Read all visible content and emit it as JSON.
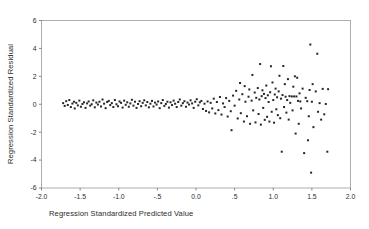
{
  "chart_data": {
    "type": "scatter",
    "title": "",
    "subtitle": "",
    "xlabel": "Regression Standardized Predicted Value",
    "ylabel": "Regression Standardized Residual",
    "xlim": [
      -2.0,
      2.0
    ],
    "ylim": [
      -6,
      6
    ],
    "xticks": [
      -2.0,
      -1.5,
      -1.0,
      -0.5,
      0.0,
      0.5,
      1.0,
      1.5,
      2.0
    ],
    "xtick_labels": [
      "-2.0",
      "-1.5",
      "-1.0",
      "-.5",
      "0.0",
      ".5",
      "1.0",
      "1.5",
      "2.0"
    ],
    "yticks": [
      -6,
      -4,
      -2,
      0,
      2,
      4,
      6
    ],
    "ytick_labels": [
      "-6",
      "-4",
      "-2",
      "0",
      "2",
      "4",
      "6"
    ],
    "grid": false,
    "legend": null,
    "legend_position": "none",
    "marker": "square",
    "marker_size": 2.0,
    "marker_color": "#262626",
    "series": [
      {
        "name": "Residuals",
        "points": [
          [
            -1.72,
            0.08
          ],
          [
            -1.7,
            -0.12
          ],
          [
            -1.68,
            0.22
          ],
          [
            -1.66,
            -0.05
          ],
          [
            -1.64,
            0.3
          ],
          [
            -1.62,
            -0.2
          ],
          [
            -1.6,
            0.05
          ],
          [
            -1.58,
            0.18
          ],
          [
            -1.57,
            -0.3
          ],
          [
            -1.55,
            0.1
          ],
          [
            -1.53,
            -0.08
          ],
          [
            -1.51,
            0.26
          ],
          [
            -1.49,
            -0.18
          ],
          [
            -1.47,
            0.02
          ],
          [
            -1.45,
            0.14
          ],
          [
            -1.43,
            -0.26
          ],
          [
            -1.41,
            0.06
          ],
          [
            -1.39,
            0.2
          ],
          [
            -1.37,
            -0.1
          ],
          [
            -1.35,
            0.0
          ],
          [
            -1.33,
            0.28
          ],
          [
            -1.31,
            -0.22
          ],
          [
            -1.29,
            0.12
          ],
          [
            -1.27,
            -0.02
          ],
          [
            -1.25,
            0.18
          ],
          [
            -1.23,
            -0.16
          ],
          [
            -1.21,
            0.34
          ],
          [
            -1.19,
            0.04
          ],
          [
            -1.17,
            -0.28
          ],
          [
            -1.15,
            0.16
          ],
          [
            -1.13,
            0.24
          ],
          [
            -1.11,
            -0.06
          ],
          [
            -1.09,
            0.08
          ],
          [
            -1.07,
            -0.2
          ],
          [
            -1.05,
            0.3
          ],
          [
            -1.03,
            0.0
          ],
          [
            -1.01,
            -0.14
          ],
          [
            -0.99,
            0.2
          ],
          [
            -0.97,
            0.1
          ],
          [
            -0.95,
            -0.24
          ],
          [
            -0.93,
            0.26
          ],
          [
            -0.91,
            -0.04
          ],
          [
            -0.89,
            0.14
          ],
          [
            -0.87,
            -0.18
          ],
          [
            -0.85,
            0.06
          ],
          [
            -0.83,
            0.32
          ],
          [
            -0.81,
            -0.1
          ],
          [
            -0.79,
            0.18
          ],
          [
            -0.77,
            -0.26
          ],
          [
            -0.75,
            0.02
          ],
          [
            -0.73,
            0.22
          ],
          [
            -0.71,
            -0.14
          ],
          [
            -0.69,
            0.1
          ],
          [
            -0.67,
            0.28
          ],
          [
            -0.65,
            -0.08
          ],
          [
            -0.63,
            0.16
          ],
          [
            -0.61,
            -0.22
          ],
          [
            -0.59,
            0.04
          ],
          [
            -0.57,
            0.24
          ],
          [
            -0.55,
            -0.16
          ],
          [
            -0.53,
            0.12
          ],
          [
            -0.51,
            -0.02
          ],
          [
            -0.49,
            0.2
          ],
          [
            -0.47,
            -0.28
          ],
          [
            -0.45,
            0.08
          ],
          [
            -0.43,
            0.3
          ],
          [
            -0.41,
            -0.12
          ],
          [
            -0.39,
            0.02
          ],
          [
            -0.37,
            0.18
          ],
          [
            -0.35,
            -0.24
          ],
          [
            -0.33,
            0.14
          ],
          [
            -0.31,
            -0.06
          ],
          [
            -0.29,
            0.26
          ],
          [
            -0.27,
            0.04
          ],
          [
            -0.25,
            -0.2
          ],
          [
            -0.23,
            0.16
          ],
          [
            -0.21,
            0.34
          ],
          [
            -0.19,
            -0.1
          ],
          [
            -0.17,
            0.08
          ],
          [
            -0.15,
            0.22
          ],
          [
            -0.13,
            -0.18
          ],
          [
            -0.11,
            0.12
          ],
          [
            -0.09,
            -0.02
          ],
          [
            -0.07,
            0.28
          ],
          [
            -0.05,
            0.06
          ],
          [
            -0.03,
            -0.26
          ],
          [
            -0.01,
            0.18
          ],
          [
            0.01,
            0.36
          ],
          [
            0.03,
            -0.08
          ],
          [
            0.05,
            0.14
          ],
          [
            0.07,
            0.24
          ],
          [
            0.09,
            -0.34
          ],
          [
            0.11,
            0.04
          ],
          [
            0.13,
            -0.48
          ],
          [
            0.15,
            0.2
          ],
          [
            0.17,
            -0.58
          ],
          [
            0.19,
            0.1
          ],
          [
            0.21,
            -0.3
          ],
          [
            0.23,
            0.4
          ],
          [
            0.25,
            -0.66
          ],
          [
            0.27,
            0.16
          ],
          [
            0.29,
            -0.42
          ],
          [
            0.31,
            0.52
          ],
          [
            0.33,
            -0.74
          ],
          [
            0.35,
            0.06
          ],
          [
            0.37,
            -0.2
          ],
          [
            0.39,
            0.44
          ],
          [
            0.41,
            -0.88
          ],
          [
            0.43,
            0.24
          ],
          [
            0.45,
            -0.5
          ],
          [
            0.46,
            -1.86
          ],
          [
            0.48,
            0.62
          ],
          [
            0.5,
            -0.1
          ],
          [
            0.52,
            0.96
          ],
          [
            0.54,
            -1.02
          ],
          [
            0.56,
            0.34
          ],
          [
            0.57,
            1.52
          ],
          [
            0.58,
            -0.64
          ],
          [
            0.6,
            0.72
          ],
          [
            0.62,
            -1.24
          ],
          [
            0.63,
            1.3
          ],
          [
            0.64,
            0.18
          ],
          [
            0.66,
            -0.86
          ],
          [
            0.68,
            0.54
          ],
          [
            0.69,
            1.06
          ],
          [
            0.7,
            -1.4
          ],
          [
            0.72,
            0.26
          ],
          [
            0.73,
            2.1
          ],
          [
            0.74,
            -0.44
          ],
          [
            0.76,
            0.84
          ],
          [
            0.77,
            -1.3
          ],
          [
            0.78,
            0.46
          ],
          [
            0.8,
            1.16
          ],
          [
            0.81,
            -0.7
          ],
          [
            0.82,
            0.34
          ],
          [
            0.83,
            2.88
          ],
          [
            0.84,
            -1.46
          ],
          [
            0.85,
            0.58
          ],
          [
            0.86,
            1.0
          ],
          [
            0.87,
            -0.26
          ],
          [
            0.88,
            0.74
          ],
          [
            0.89,
            -1.12
          ],
          [
            0.9,
            0.44
          ],
          [
            0.91,
            1.34
          ],
          [
            0.92,
            -0.9
          ],
          [
            0.93,
            0.64
          ],
          [
            0.94,
            0.16
          ],
          [
            0.95,
            -1.24
          ],
          [
            0.96,
            0.86
          ],
          [
            0.97,
            2.72
          ],
          [
            0.98,
            -0.54
          ],
          [
            0.99,
            1.56
          ],
          [
            1.0,
            0.3
          ],
          [
            1.01,
            -1.32
          ],
          [
            1.02,
            0.7
          ],
          [
            1.03,
            1.12
          ],
          [
            1.04,
            -0.36
          ],
          [
            1.05,
            0.5
          ],
          [
            1.06,
            -0.78
          ],
          [
            1.07,
            0.92
          ],
          [
            1.08,
            2.04
          ],
          [
            1.09,
            -1.0
          ],
          [
            1.1,
            0.4
          ],
          [
            1.11,
            -3.4
          ],
          [
            1.12,
            0.66
          ],
          [
            1.13,
            2.74
          ],
          [
            1.14,
            -0.2
          ],
          [
            1.15,
            1.44
          ],
          [
            1.16,
            0.54
          ],
          [
            1.17,
            -0.6
          ],
          [
            1.18,
            0.3
          ],
          [
            1.19,
            1.8
          ],
          [
            1.2,
            -1.1
          ],
          [
            1.21,
            0.58
          ],
          [
            1.22,
            0.1
          ],
          [
            1.24,
            0.56
          ],
          [
            1.25,
            -0.44
          ],
          [
            1.26,
            1.26
          ],
          [
            1.27,
            0.56
          ],
          [
            1.28,
            2.0
          ],
          [
            1.29,
            -2.1
          ],
          [
            1.3,
            0.56
          ],
          [
            1.31,
            1.9
          ],
          [
            1.32,
            0.24
          ],
          [
            1.33,
            -1.4
          ],
          [
            1.34,
            0.78
          ],
          [
            1.35,
            0.2
          ],
          [
            1.36,
            -0.3
          ],
          [
            1.38,
            1.12
          ],
          [
            1.4,
            -3.5
          ],
          [
            1.42,
            0.46
          ],
          [
            1.44,
            0.22
          ],
          [
            1.45,
            -2.58
          ],
          [
            1.46,
            -0.86
          ],
          [
            1.47,
            1.02
          ],
          [
            1.48,
            4.28
          ],
          [
            1.49,
            -4.9
          ],
          [
            1.5,
            0.18
          ],
          [
            1.51,
            1.44
          ],
          [
            1.52,
            -1.64
          ],
          [
            1.55,
            0.92
          ],
          [
            1.57,
            3.62
          ],
          [
            1.58,
            -0.54
          ],
          [
            1.6,
            0.08
          ],
          [
            1.62,
            -1.1
          ],
          [
            1.64,
            1.1
          ],
          [
            1.66,
            -0.72
          ],
          [
            1.68,
            0.02
          ],
          [
            1.7,
            -3.4
          ],
          [
            1.71,
            1.08
          ]
        ]
      }
    ]
  },
  "figure": {
    "background_color": "#ffffff",
    "frame_color": "#9a9a9a",
    "text_color": "#2b2b2b"
  }
}
